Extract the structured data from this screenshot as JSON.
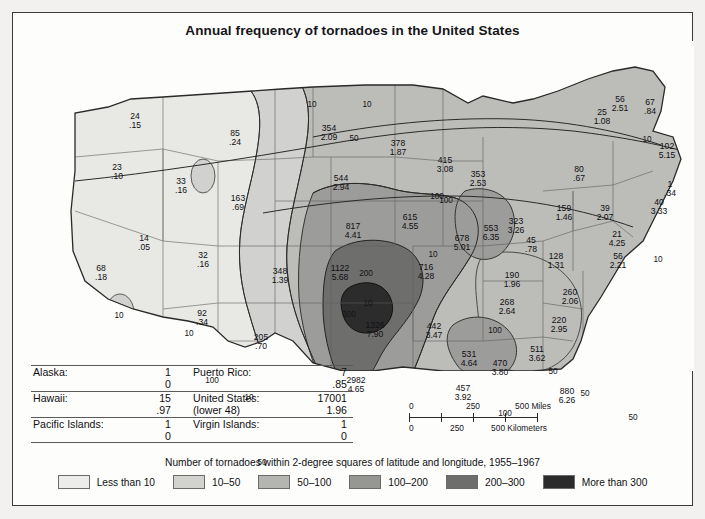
{
  "title": "Annual frequency of tornadoes in the United States",
  "caption": "Number of tornadoes within 2-degree squares of latitude and longitude, 1955–1967",
  "legend": {
    "items": [
      {
        "label": "Less than 10",
        "color": "#ececea"
      },
      {
        "label": "10–50",
        "color": "#d2d2cf"
      },
      {
        "label": "50–100",
        "color": "#b4b4b1"
      },
      {
        "label": "100–200",
        "color": "#969693"
      },
      {
        "label": "200–300",
        "color": "#6e6e6c"
      },
      {
        "label": "More than 300",
        "color": "#2b2b2b"
      }
    ]
  },
  "scale": {
    "miles": {
      "ticks": [
        "0",
        "250",
        "500 Miles"
      ]
    },
    "kilometers": {
      "ticks": [
        "0",
        "250",
        "500 Kilometers"
      ]
    }
  },
  "stats": {
    "rows": [
      {
        "left_label": "Alaska:",
        "left_count": "1",
        "left_rate": "0",
        "right_label": "Puerto Rico:",
        "right_count": "7",
        "right_rate": ".85"
      },
      {
        "left_label": "Hawaii:",
        "left_count": "15",
        "left_rate": ".97",
        "right_label": "United States:",
        "right_count": "17001",
        "right_sub": "(lower 48)",
        "right_rate": "1.96"
      },
      {
        "left_label": "Pacific Islands:",
        "left_count": "1",
        "left_rate": "0",
        "right_label": "Virgin Islands:",
        "right_count": "1",
        "right_rate": "0"
      }
    ]
  },
  "chart_data": {
    "type": "map",
    "title": "Annual frequency of tornadoes in the United States",
    "subtitle": "Number of tornadoes within 2-degree squares of latitude and longitude, 1955–1967",
    "value_fields": [
      "total_tornadoes",
      "annual_rate"
    ],
    "contour_levels": [
      10,
      50,
      100,
      200,
      300
    ],
    "states": [
      {
        "name": "Washington",
        "count": "24",
        "rate": ".15",
        "x": 122,
        "y": 80
      },
      {
        "name": "Oregon",
        "count": "23",
        "rate": ".10",
        "x": 104,
        "y": 131
      },
      {
        "name": "Idaho",
        "count": "33",
        "rate": ".16",
        "x": 168,
        "y": 145
      },
      {
        "name": "Montana",
        "count": "85",
        "rate": ".24",
        "x": 222,
        "y": 97
      },
      {
        "name": "Wyoming",
        "count": "163",
        "rate": ".69",
        "x": 225,
        "y": 162
      },
      {
        "name": "Nevada",
        "count": "14",
        "rate": ".05",
        "x": 131,
        "y": 202
      },
      {
        "name": "California",
        "count": "68",
        "rate": ".18",
        "x": 88,
        "y": 232
      },
      {
        "name": "Utah",
        "count": "32",
        "rate": ".16",
        "x": 190,
        "y": 219
      },
      {
        "name": "Arizona",
        "count": "92",
        "rate": ".34",
        "x": 189,
        "y": 277
      },
      {
        "name": "New Mexico",
        "count": "205",
        "rate": ".70",
        "x": 248,
        "y": 301
      },
      {
        "name": "Colorado",
        "count": "348",
        "rate": "1.39",
        "x": 267,
        "y": 235
      },
      {
        "name": "North Dakota",
        "count": "354",
        "rate": "2.09",
        "x": 316,
        "y": 92
      },
      {
        "name": "South Dakota",
        "count": "544",
        "rate": "2.94",
        "x": 328,
        "y": 142
      },
      {
        "name": "Nebraska",
        "count": "817",
        "rate": "4.41",
        "x": 340,
        "y": 190
      },
      {
        "name": "Kansas",
        "count": "1122",
        "rate": "5.68",
        "x": 327,
        "y": 232
      },
      {
        "name": "Oklahoma",
        "count": "1326",
        "rate": "7.90",
        "x": 362,
        "y": 289
      },
      {
        "name": "Texas",
        "count": "2982",
        "rate": "4.65",
        "x": 343,
        "y": 344
      },
      {
        "name": "Minnesota",
        "count": "378",
        "rate": "1.87",
        "x": 385,
        "y": 107
      },
      {
        "name": "Iowa",
        "count": "615",
        "rate": "4.55",
        "x": 397,
        "y": 181
      },
      {
        "name": "Missouri",
        "count": "716",
        "rate": "4.28",
        "x": 413,
        "y": 231
      },
      {
        "name": "Arkansas",
        "count": "442",
        "rate": "3.47",
        "x": 421,
        "y": 290
      },
      {
        "name": "Louisiana",
        "count": "457",
        "rate": "3.92",
        "x": 450,
        "y": 352
      },
      {
        "name": "Wisconsin",
        "count": "415",
        "rate": "3.08",
        "x": 432,
        "y": 124
      },
      {
        "name": "Michigan",
        "count": "353",
        "rate": "2.53",
        "x": 465,
        "y": 138
      },
      {
        "name": "Illinois",
        "count": "678",
        "rate": "5.01",
        "x": 449,
        "y": 202
      },
      {
        "name": "Indiana",
        "count": "553",
        "rate": "6.35",
        "x": 478,
        "y": 192
      },
      {
        "name": "Ohio",
        "count": "323",
        "rate": "3.26",
        "x": 503,
        "y": 185
      },
      {
        "name": "Kentucky",
        "count": "190",
        "rate": "1.96",
        "x": 499,
        "y": 239
      },
      {
        "name": "Tennessee",
        "count": "268",
        "rate": "2.64",
        "x": 494,
        "y": 266
      },
      {
        "name": "Mississippi",
        "count": "531",
        "rate": "4.64",
        "x": 456,
        "y": 318
      },
      {
        "name": "Alabama",
        "count": "470",
        "rate": "3.80",
        "x": 487,
        "y": 327
      },
      {
        "name": "Georgia",
        "count": "511",
        "rate": "3.62",
        "x": 524,
        "y": 313
      },
      {
        "name": "Florida",
        "count": "880",
        "rate": "6.26",
        "x": 554,
        "y": 355
      },
      {
        "name": "South Carolina",
        "count": "220",
        "rate": "2.95",
        "x": 546,
        "y": 284
      },
      {
        "name": "North Carolina",
        "count": "260",
        "rate": "2.06",
        "x": 557,
        "y": 256
      },
      {
        "name": "Virginia",
        "count": "128",
        "rate": "1.31",
        "x": 543,
        "y": 220
      },
      {
        "name": "West Virginia",
        "count": "45",
        "rate": ".78",
        "x": 518,
        "y": 204
      },
      {
        "name": "Pennsylvania",
        "count": "159",
        "rate": "1.46",
        "x": 551,
        "y": 172
      },
      {
        "name": "New York",
        "count": "80",
        "rate": ".67",
        "x": 566,
        "y": 133
      },
      {
        "name": "Vermont",
        "count": "25",
        "rate": "1.08",
        "x": 589,
        "y": 76
      },
      {
        "name": "New Hampshire",
        "count": "56",
        "rate": "2.51",
        "x": 607,
        "y": 63
      },
      {
        "name": "Maine",
        "count": "67",
        "rate": ".84",
        "x": 637,
        "y": 66
      },
      {
        "name": "Massachusetts",
        "count": "102",
        "rate": "5.15",
        "x": 654,
        "y": 110
      },
      {
        "name": "Rhode Island",
        "count": "1",
        "rate": ".34",
        "x": 657,
        "y": 148
      },
      {
        "name": "Connecticut",
        "count": "40",
        "rate": "3.33",
        "x": 646,
        "y": 166
      },
      {
        "name": "New Jersey",
        "count": "39",
        "rate": "2.07",
        "x": 592,
        "y": 172
      },
      {
        "name": "Delaware",
        "count": "21",
        "rate": "4.25",
        "x": 604,
        "y": 198
      },
      {
        "name": "Maryland",
        "count": "56",
        "rate": "2.21",
        "x": 605,
        "y": 220
      }
    ],
    "isoline_labels": [
      {
        "text": "10",
        "x": 299,
        "y": 63
      },
      {
        "text": "10",
        "x": 354,
        "y": 63
      },
      {
        "text": "50",
        "x": 341,
        "y": 97
      },
      {
        "text": "100",
        "x": 433,
        "y": 159
      },
      {
        "text": "100",
        "x": 424,
        "y": 155
      },
      {
        "text": "200",
        "x": 353,
        "y": 232
      },
      {
        "text": "300",
        "x": 336,
        "y": 273
      },
      {
        "text": "100",
        "x": 199,
        "y": 339
      },
      {
        "text": "10",
        "x": 236,
        "y": 356
      },
      {
        "text": "10",
        "x": 106,
        "y": 274
      },
      {
        "text": "10",
        "x": 176,
        "y": 292
      },
      {
        "text": "10",
        "x": 420,
        "y": 213
      },
      {
        "text": "10",
        "x": 355,
        "y": 262
      },
      {
        "text": "100",
        "x": 482,
        "y": 289
      },
      {
        "text": "100",
        "x": 492,
        "y": 372
      },
      {
        "text": "50",
        "x": 540,
        "y": 330
      },
      {
        "text": "50",
        "x": 572,
        "y": 352
      },
      {
        "text": "50",
        "x": 249,
        "y": 421
      },
      {
        "text": "50",
        "x": 620,
        "y": 376
      },
      {
        "text": "10",
        "x": 634,
        "y": 98
      },
      {
        "text": "10",
        "x": 645,
        "y": 218
      }
    ]
  }
}
